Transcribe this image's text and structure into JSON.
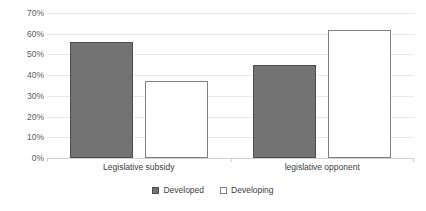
{
  "chart_data": {
    "type": "bar",
    "title": "",
    "subtitle": "",
    "xlabel": "",
    "ylabel": "",
    "categories": [
      "Legislative subsidy",
      "legislative opponent"
    ],
    "series": [
      {
        "name": "Developed",
        "values": [
          56,
          45
        ],
        "color": "#737373",
        "border": "#4d4d4d"
      },
      {
        "name": "Developing",
        "values": [
          37,
          62
        ],
        "color": "#ffffff",
        "border": "#808080"
      }
    ],
    "ylim": [
      0,
      70
    ],
    "ytick_values": [
      0,
      10,
      20,
      30,
      40,
      50,
      60,
      70
    ],
    "ytick_labels": [
      "0%",
      "10%",
      "20%",
      "30%",
      "40%",
      "50%",
      "60%",
      "70%"
    ],
    "ytick_format": "percent",
    "ytick_step": 10,
    "grid": true,
    "grid_axis": "y",
    "legend_position": "bottom-center",
    "annotations": []
  },
  "legend": {
    "items": [
      {
        "label": "Developed",
        "marker": "filled-square-icon"
      },
      {
        "label": "Developing",
        "marker": "outlined-square-icon"
      }
    ]
  }
}
